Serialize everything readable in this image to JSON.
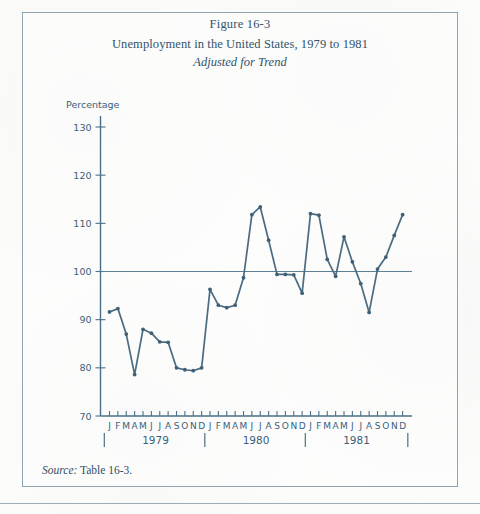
{
  "figure": {
    "number_line": "Figure 16-3",
    "title": "Unemployment in the United States, 1979 to 1981",
    "subtitle": "Adjusted for Trend",
    "axis_unit_label": "Percentage",
    "source_label": "Source:",
    "source_text": " Table 16-3."
  },
  "colors": {
    "line": "#4a6b80",
    "axis": "#4a7189",
    "text": "#31536b",
    "frame": "#8fa6b2",
    "reference": "#5b7f95"
  },
  "chart_data": {
    "type": "line",
    "title": "Unemployment in the United States, 1979 to 1981",
    "subtitle": "Adjusted for Trend",
    "xlabel": "",
    "ylabel": "Percentage",
    "ylim": [
      70,
      130
    ],
    "yticks": [
      70,
      80,
      90,
      100,
      110,
      120,
      130
    ],
    "ytick_labels": [
      "70",
      "80",
      "90",
      "100",
      "110",
      "120",
      "130"
    ],
    "grid": false,
    "reference_line": 100,
    "legend": "none",
    "years": [
      "1979",
      "1980",
      "1981"
    ],
    "month_labels": [
      "J",
      "F",
      "M",
      "A",
      "M",
      "J",
      "J",
      "A",
      "S",
      "O",
      "N",
      "D"
    ],
    "x": [
      "1979-J",
      "1979-F",
      "1979-M",
      "1979-A",
      "1979-M",
      "1979-J",
      "1979-J",
      "1979-A",
      "1979-S",
      "1979-O",
      "1979-N",
      "1979-D",
      "1980-J",
      "1980-F",
      "1980-M",
      "1980-A",
      "1980-M",
      "1980-J",
      "1980-J",
      "1980-A",
      "1980-S",
      "1980-O",
      "1980-N",
      "1980-D",
      "1981-J",
      "1981-F",
      "1981-M",
      "1981-A",
      "1981-M",
      "1981-J",
      "1981-J",
      "1981-A",
      "1981-S",
      "1981-O",
      "1981-N",
      "1981-D"
    ],
    "values": [
      91.6,
      92.3,
      87.0,
      78.6,
      88.0,
      87.2,
      85.4,
      85.3,
      80.0,
      79.6,
      79.4,
      80.0,
      96.3,
      93.0,
      92.5,
      93.0,
      98.7,
      111.8,
      113.4,
      106.5,
      99.4,
      99.4,
      99.3,
      95.5,
      112.0,
      111.7,
      102.5,
      99.0,
      107.2,
      102.0,
      97.5,
      91.5,
      100.5,
      103.0,
      107.5,
      111.8
    ]
  }
}
